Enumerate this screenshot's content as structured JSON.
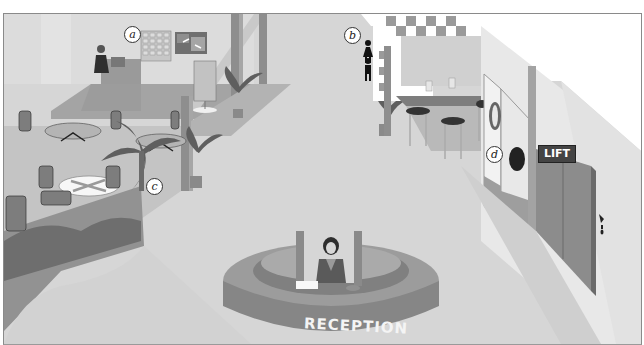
{
  "scene": {
    "title": "Hotel lobby illustration",
    "colors": {
      "floor": "#d6d6d6",
      "back_wall": "#e6e6e6",
      "carpet_dark": "#9e9e9e",
      "desk": "#8a8a8a",
      "desk_top": "#a8a8a8",
      "planter": "#929292",
      "lift_door": "#8c8c8c",
      "white_wall": "#ffffff",
      "lift_sign_bg": "#444444"
    }
  },
  "labels": {
    "a": "a",
    "b": "b",
    "c": "c",
    "d": "d"
  },
  "areas": {
    "a": {
      "description": "front desk with key rack and notice board"
    },
    "b": {
      "description": "restroom sign with female and male figures"
    },
    "c": {
      "description": "cafe seating area with tables, chairs and plants"
    },
    "d": {
      "description": "telephone booth"
    }
  },
  "signs": {
    "reception": "RECEPTION",
    "lift": "LIFT"
  }
}
